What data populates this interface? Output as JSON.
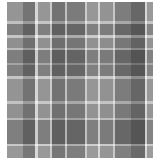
{
  "image": {
    "subject": "Grayscale plaid / tartan fabric swatch",
    "background": "#ffffff",
    "swatch": {
      "x": 7,
      "y": 2,
      "width": 146,
      "height": 156,
      "base_color": "#8a8a8a"
    }
  },
  "pattern": {
    "horizontal_bands": [
      {
        "y": 0,
        "h": 19,
        "color": "#8e8e8e",
        "opacity": 0.55
      },
      {
        "y": 19,
        "h": 3,
        "color": "#e8e8e8",
        "opacity": 0.85
      },
      {
        "y": 22,
        "h": 11,
        "color": "#4e4e4e",
        "opacity": 0.6
      },
      {
        "y": 33,
        "h": 3,
        "color": "#f2f2f2",
        "opacity": 0.85
      },
      {
        "y": 36,
        "h": 10,
        "color": "#7a7a7a",
        "opacity": 0.5
      },
      {
        "y": 46,
        "h": 2,
        "color": "#e8e8e8",
        "opacity": 0.8
      },
      {
        "y": 48,
        "h": 13,
        "color": "#4a4a4a",
        "opacity": 0.6
      },
      {
        "y": 61,
        "h": 2,
        "color": "#bdbdbd",
        "opacity": 0.6
      },
      {
        "y": 63,
        "h": 11,
        "color": "#505050",
        "opacity": 0.6
      },
      {
        "y": 74,
        "h": 3,
        "color": "#f2f2f2",
        "opacity": 0.85
      },
      {
        "y": 77,
        "h": 22,
        "color": "#8c8c8c",
        "opacity": 0.5
      },
      {
        "y": 99,
        "h": 3,
        "color": "#ececec",
        "opacity": 0.85
      },
      {
        "y": 102,
        "h": 14,
        "color": "#828282",
        "opacity": 0.5
      },
      {
        "y": 116,
        "h": 2,
        "color": "#e0e0e0",
        "opacity": 0.8
      },
      {
        "y": 118,
        "h": 24,
        "color": "#4c4c4c",
        "opacity": 0.6
      },
      {
        "y": 142,
        "h": 2,
        "color": "#f4f4f4",
        "opacity": 0.9
      },
      {
        "y": 144,
        "h": 12,
        "color": "#9a9a9a",
        "opacity": 0.5
      }
    ],
    "vertical_bands": [
      {
        "x": 0,
        "w": 16,
        "color": "#a0a0a0",
        "opacity": 0.45
      },
      {
        "x": 16,
        "w": 12,
        "color": "#5c5c5c",
        "opacity": 0.5
      },
      {
        "x": 28,
        "w": 3,
        "color": "#efefef",
        "opacity": 0.75
      },
      {
        "x": 31,
        "w": 12,
        "color": "#a4a4a4",
        "opacity": 0.4
      },
      {
        "x": 43,
        "w": 2,
        "color": "#e6e6e6",
        "opacity": 0.7
      },
      {
        "x": 45,
        "w": 13,
        "color": "#5a5a5a",
        "opacity": 0.5
      },
      {
        "x": 58,
        "w": 2,
        "color": "#dcdcdc",
        "opacity": 0.65
      },
      {
        "x": 60,
        "w": 18,
        "color": "#666666",
        "opacity": 0.45
      },
      {
        "x": 78,
        "w": 2,
        "color": "#e6e6e6",
        "opacity": 0.7
      },
      {
        "x": 80,
        "w": 11,
        "color": "#a8a8a8",
        "opacity": 0.4
      },
      {
        "x": 91,
        "w": 2,
        "color": "#eeeeee",
        "opacity": 0.75
      },
      {
        "x": 93,
        "w": 13,
        "color": "#9e9e9e",
        "opacity": 0.4
      },
      {
        "x": 106,
        "w": 2,
        "color": "#e0e0e0",
        "opacity": 0.7
      },
      {
        "x": 108,
        "w": 16,
        "color": "#6a6a6a",
        "opacity": 0.45
      },
      {
        "x": 124,
        "w": 14,
        "color": "#484848",
        "opacity": 0.55
      },
      {
        "x": 138,
        "w": 2,
        "color": "#f0f0f0",
        "opacity": 0.75
      },
      {
        "x": 140,
        "w": 6,
        "color": "#a8a8a8",
        "opacity": 0.45
      }
    ]
  }
}
